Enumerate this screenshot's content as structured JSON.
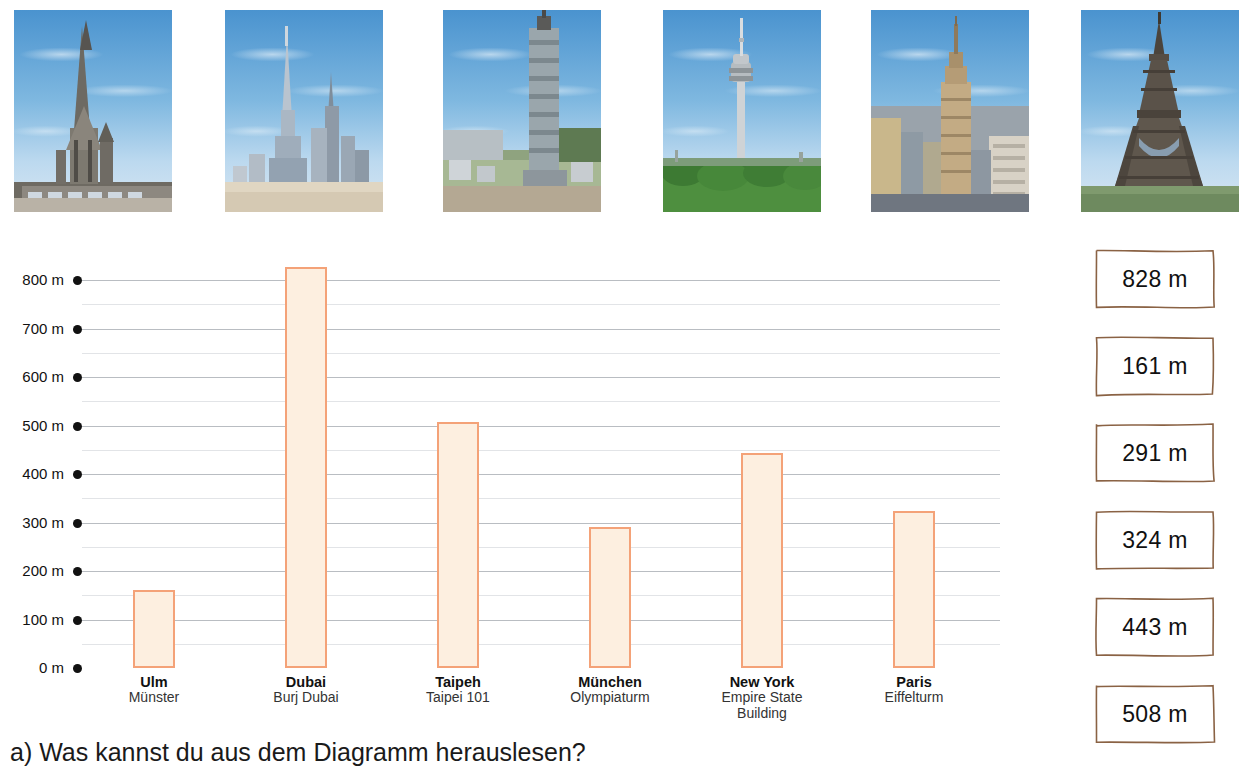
{
  "photos": [
    {
      "name": "ulm-muenster-photo",
      "alt": "Ulmer Münster"
    },
    {
      "name": "burj-dubai-photo",
      "alt": "Burj Dubai"
    },
    {
      "name": "taipei-101-photo",
      "alt": "Taipei 101"
    },
    {
      "name": "olympiaturm-photo",
      "alt": "Olympiaturm München"
    },
    {
      "name": "empire-state-building-photo",
      "alt": "Empire State Building"
    },
    {
      "name": "eiffelturm-photo",
      "alt": "Eiffelturm"
    }
  ],
  "chart_data": {
    "type": "bar",
    "title": "",
    "xlabel": "",
    "ylabel": "",
    "ylim": [
      0,
      850
    ],
    "grid": true,
    "legend": false,
    "unit": "m",
    "y_ticks": [
      "800 m",
      "700 m",
      "600 m",
      "500 m",
      "400 m",
      "300 m",
      "200 m",
      "100 m",
      "0 m"
    ],
    "y_tick_values": [
      800,
      700,
      600,
      500,
      400,
      300,
      200,
      100,
      0
    ],
    "minor_gridline_step": 50,
    "categories": [
      "Ulm",
      "Dubai",
      "Taipeh",
      "München",
      "New York",
      "Paris"
    ],
    "category_sublabels": [
      "Münster",
      "Burj Dubai",
      "Taipei 101",
      "Olympiaturm",
      "Empire State Building",
      "Eiffelturm"
    ],
    "values": [
      161,
      828,
      508,
      291,
      443,
      324
    ],
    "bar_fill": "#fdefe0",
    "bar_border": "#f4a278"
  },
  "value_boxes": {
    "name": "value-box-list",
    "items": [
      "828 m",
      "161 m",
      "291 m",
      "324 m",
      "443 m",
      "508 m"
    ],
    "border_color": "#8a6244"
  },
  "question": {
    "text": "a) Was kannst du aus dem Diagramm herauslesen?"
  }
}
